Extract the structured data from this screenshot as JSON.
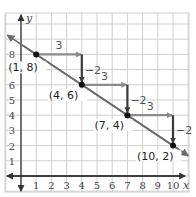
{
  "chart_data": {
    "type": "line",
    "title": "",
    "xlabel": "x",
    "ylabel": "y",
    "xlim": [
      -1,
      11
    ],
    "ylim": [
      -1,
      10
    ],
    "grid": true,
    "x_ticks": [
      "1",
      "2",
      "3",
      "4",
      "5",
      "6",
      "7",
      "8",
      "9",
      "10"
    ],
    "y_ticks": [
      "1",
      "2",
      "3",
      "4",
      "5",
      "6",
      "7",
      "8"
    ],
    "series": [
      {
        "name": "line",
        "points": [
          {
            "x": 1,
            "y": 8,
            "label": "(1, 8)"
          },
          {
            "x": 4,
            "y": 6,
            "label": "(4, 6)"
          },
          {
            "x": 7,
            "y": 4,
            "label": "(7, 4)"
          },
          {
            "x": 10,
            "y": 2,
            "label": "(10, 2)"
          }
        ],
        "slope": "-2/3"
      }
    ],
    "annotations": {
      "run_label": "3",
      "rise_label": "−2",
      "steps": [
        {
          "from": [
            1,
            8
          ],
          "run_to": [
            4,
            8
          ],
          "rise_to": [
            4,
            6
          ]
        },
        {
          "from": [
            4,
            6
          ],
          "run_to": [
            7,
            6
          ],
          "rise_to": [
            7,
            4
          ]
        },
        {
          "from": [
            7,
            4
          ],
          "run_to": [
            10,
            4
          ],
          "rise_to": [
            10,
            2
          ]
        }
      ]
    },
    "colors": {
      "grid": "#cfcfcf",
      "axis": "#333333",
      "line": "#6b6b6b",
      "run_arrow": "#8a8a8a",
      "rise_arrow": "#3a3a3a",
      "point": "#111111"
    }
  }
}
